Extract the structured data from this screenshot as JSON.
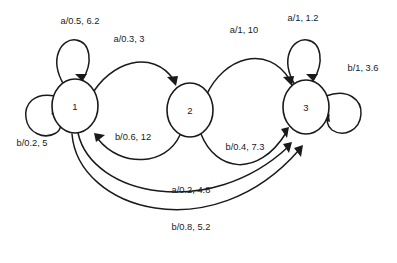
{
  "diagram": {
    "type": "finite-state-machine",
    "title": "",
    "label_format": "input/probability, cost",
    "background_color": "#ffffff",
    "stroke_color": "#1a1a1a",
    "states": [
      {
        "id": "1",
        "label": "1",
        "cx": 75,
        "cy": 106,
        "rx": 23,
        "ry": 27
      },
      {
        "id": "2",
        "label": "2",
        "cx": 190,
        "cy": 110,
        "rx": 23,
        "ry": 27
      },
      {
        "id": "3",
        "label": "3",
        "cx": 306,
        "cy": 107,
        "rx": 23,
        "ry": 27
      }
    ],
    "transitions": [
      {
        "id": "t1",
        "from": "1",
        "to": "1",
        "kind": "self-loop",
        "input": "a",
        "probability": "0.5",
        "cost": "6.2",
        "label": "a/0.5, 6.2",
        "label_x": 80,
        "label_y": 21
      },
      {
        "id": "t2",
        "from": "1",
        "to": "1",
        "kind": "self-loop",
        "input": "b",
        "probability": "0.2",
        "cost": "5",
        "label": "b/0.2, 5",
        "label_x": 32,
        "label_y": 143
      },
      {
        "id": "t3",
        "from": "1",
        "to": "2",
        "kind": "curve",
        "input": "a",
        "probability": "0.3",
        "cost": "3",
        "label": "a/0.3, 3",
        "label_x": 129,
        "label_y": 39
      },
      {
        "id": "t4",
        "from": "2",
        "to": "1",
        "kind": "curve",
        "input": "b",
        "probability": "0.6",
        "cost": "12",
        "label": "b/0.6, 12",
        "label_x": 133,
        "label_y": 137
      },
      {
        "id": "t5",
        "from": "2",
        "to": "3",
        "kind": "curve",
        "input": "a",
        "probability": "1",
        "cost": "10",
        "label": "a/1, 10",
        "label_x": 244,
        "label_y": 30
      },
      {
        "id": "t6",
        "from": "2",
        "to": "3",
        "kind": "curve",
        "input": "b",
        "probability": "0.4",
        "cost": "7.3",
        "label": "b/0.4, 7.3",
        "label_x": 245,
        "label_y": 147
      },
      {
        "id": "t7",
        "from": "3",
        "to": "3",
        "kind": "self-loop",
        "input": "a",
        "probability": "1",
        "cost": "1.2",
        "label": "a/1, 1.2",
        "label_x": 303,
        "label_y": 18
      },
      {
        "id": "t8",
        "from": "3",
        "to": "3",
        "kind": "self-loop",
        "input": "b",
        "probability": "1",
        "cost": "3.6",
        "label": "b/1, 3.6",
        "label_x": 363,
        "label_y": 68
      },
      {
        "id": "t9",
        "from": "1",
        "to": "3",
        "kind": "long-curve",
        "input": "a",
        "probability": "0.2",
        "cost": "4.8",
        "label": "a/0.2, 4.8",
        "label_x": 191,
        "label_y": 190
      },
      {
        "id": "t10",
        "from": "1",
        "to": "3",
        "kind": "long-curve",
        "input": "b",
        "probability": "0.8",
        "cost": "5.2",
        "label": "b/0.8, 5.2",
        "label_x": 191,
        "label_y": 227
      }
    ]
  }
}
